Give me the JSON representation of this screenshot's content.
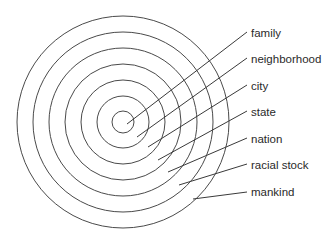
{
  "diagram": {
    "type": "concentric-circles",
    "center": [
      123,
      122
    ],
    "colors": {
      "stroke": "#4a4a4a",
      "text": "#2a2a2a",
      "background": "#ffffff"
    },
    "rings": [
      {
        "label": "family",
        "radius": 11,
        "line_start": [
          127,
          124
        ],
        "line_end": [
          247,
          32
        ],
        "label_top": 26
      },
      {
        "label": "neighborhood",
        "radius": 26,
        "line_start": [
          137,
          137
        ],
        "line_end": [
          247,
          58
        ],
        "label_top": 52
      },
      {
        "label": "city",
        "radius": 42,
        "line_start": [
          148,
          147
        ],
        "line_end": [
          247,
          85
        ],
        "label_top": 79
      },
      {
        "label": "state",
        "radius": 58,
        "line_start": [
          158,
          160
        ],
        "line_end": [
          247,
          111
        ],
        "label_top": 105
      },
      {
        "label": "nation",
        "radius": 74,
        "line_start": [
          168,
          172
        ],
        "line_end": [
          247,
          138
        ],
        "label_top": 132
      },
      {
        "label": "racial stock",
        "radius": 90,
        "line_start": [
          179,
          185
        ],
        "line_end": [
          247,
          164
        ],
        "label_top": 158
      },
      {
        "label": "mankind",
        "radius": 106,
        "line_start": [
          193,
          199
        ],
        "line_end": [
          247,
          192
        ],
        "label_top": 185
      }
    ]
  }
}
